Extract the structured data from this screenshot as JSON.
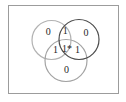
{
  "figure": {
    "type": "venn-diagram-3-sets",
    "background_color": "#ffffff",
    "text_color": "#1f1f1f",
    "frame": {
      "border_color": "#9c9c9c"
    },
    "circles": {
      "left": {
        "stroke_color": "#b2b2b2"
      },
      "right": {
        "stroke_color": "#4c4c4c"
      },
      "bottom": {
        "stroke_color": "#a3a3a3"
      }
    },
    "region_labels": {
      "left_only": "0",
      "left_right_overlap": "1",
      "right_only": "0",
      "left_bottom_overlap": "1",
      "center_all_three": "1*",
      "right_bottom_overlap": "1",
      "bottom_only": "0"
    }
  }
}
